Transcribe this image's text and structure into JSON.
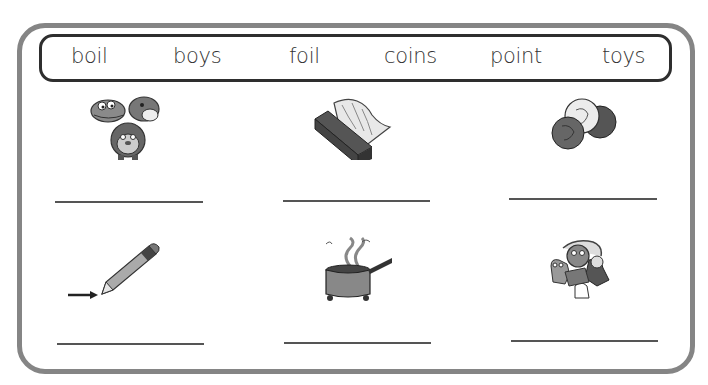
{
  "worksheet": {
    "word_bank": {
      "words": [
        "boil",
        "boys",
        "foil",
        "coins",
        "point",
        "toys"
      ]
    },
    "items": [
      {
        "picture": "toys-animals-picture",
        "answer": ""
      },
      {
        "picture": "foil-roll-picture",
        "answer": ""
      },
      {
        "picture": "coins-picture",
        "answer": ""
      },
      {
        "picture": "pencil-point-picture",
        "answer": ""
      },
      {
        "picture": "boiling-pot-picture",
        "answer": ""
      },
      {
        "picture": "stuffed-toys-picture",
        "answer": ""
      }
    ],
    "colors": {
      "frame": "#858585",
      "word_bank_border": "#2e2e2e",
      "text": "#333333",
      "answer_line": "#555555"
    }
  }
}
